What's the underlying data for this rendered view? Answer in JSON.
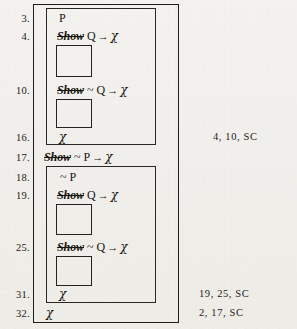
{
  "figure": {
    "background_color": "#f1efeb",
    "ink_color": "#1a1a1a"
  },
  "line_numbers": [
    {
      "id": "ln-3",
      "label": "3."
    },
    {
      "id": "ln-4",
      "label": "4."
    },
    {
      "id": "ln-10",
      "label": "10."
    },
    {
      "id": "ln-16",
      "label": "16."
    },
    {
      "id": "ln-17",
      "label": "17."
    },
    {
      "id": "ln-18",
      "label": "18."
    },
    {
      "id": "ln-19",
      "label": "19."
    },
    {
      "id": "ln-25",
      "label": "25."
    },
    {
      "id": "ln-31",
      "label": "31."
    },
    {
      "id": "ln-32",
      "label": "32."
    }
  ],
  "formulas": {
    "line3": {
      "show": "",
      "body": "P"
    },
    "line4": {
      "show": "Show",
      "body": "Q → χ"
    },
    "line10": {
      "show": "Show",
      "body": "~ Q → χ"
    },
    "line16": {
      "show": "",
      "body": "χ"
    },
    "line17": {
      "show": "Show",
      "body": "~ P → χ"
    },
    "line18": {
      "show": "",
      "body": "~ P"
    },
    "line19": {
      "show": "Show",
      "body": "Q → χ"
    },
    "line25": {
      "show": "Show",
      "body": "~ Q → χ"
    },
    "line31": {
      "show": "",
      "body": "χ"
    },
    "line32": {
      "show": "",
      "body": "χ"
    }
  },
  "formula_parts": {
    "line3": {
      "show": "",
      "neg": "",
      "prop": "P",
      "arrow": "",
      "conseq": ""
    },
    "line4": {
      "show": "Show",
      "neg": "",
      "prop": "Q",
      "arrow": "→",
      "conseq": "χ"
    },
    "line10": {
      "show": "Show",
      "neg": "~",
      "prop": "Q",
      "arrow": "→",
      "conseq": "χ"
    },
    "line16": {
      "show": "",
      "neg": "",
      "prop": "",
      "arrow": "",
      "conseq": "χ"
    },
    "line17": {
      "show": "Show",
      "neg": "~",
      "prop": "P",
      "arrow": "→",
      "conseq": "χ"
    },
    "line18": {
      "show": "",
      "neg": "~",
      "prop": "P",
      "arrow": "",
      "conseq": ""
    },
    "line19": {
      "show": "Show",
      "neg": "",
      "prop": "Q",
      "arrow": "→",
      "conseq": "χ"
    },
    "line25": {
      "show": "Show",
      "neg": "~",
      "prop": "Q",
      "arrow": "→",
      "conseq": "χ"
    },
    "line31": {
      "show": "",
      "neg": "",
      "prop": "",
      "arrow": "",
      "conseq": "χ"
    },
    "line32": {
      "show": "",
      "neg": "",
      "prop": "",
      "arrow": "",
      "conseq": "χ"
    }
  },
  "justifications": [
    {
      "id": "just-16",
      "line": "16",
      "text": "4,  10,  SC"
    },
    {
      "id": "just-31",
      "line": "31",
      "text": "19,  25,  SC"
    },
    {
      "id": "just-32",
      "line": "32",
      "text": "2,  17,  SC"
    }
  ],
  "boxes": {
    "outer": {
      "name": "outer-derivation-box"
    },
    "sub_upper": {
      "name": "upper-subderivation-box"
    },
    "sub_lower": {
      "name": "lower-subderivation-box"
    },
    "blank_1": {
      "name": "blank-subproof-box-1"
    },
    "blank_2": {
      "name": "blank-subproof-box-2"
    },
    "blank_3": {
      "name": "blank-subproof-box-3"
    },
    "blank_4": {
      "name": "blank-subproof-box-4"
    }
  }
}
